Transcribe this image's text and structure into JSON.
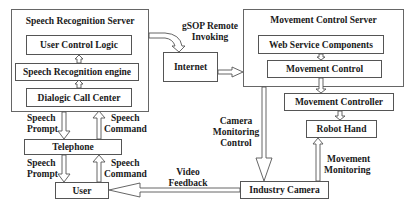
{
  "speech_server": {
    "title": "Speech Recognition Server",
    "components": [
      "User Control Logic",
      "Speech Recognition engine",
      "Dialogic Call Center"
    ]
  },
  "internet": {
    "label": "Internet"
  },
  "movement_server": {
    "title": "Movement Control Server",
    "components": [
      "Web Service Components",
      "Movement Control"
    ]
  },
  "movement_controller": {
    "label": "Movement Controller"
  },
  "robot_hand": {
    "label": "Robot Hand"
  },
  "telephone": {
    "label": "Telephone"
  },
  "user": {
    "label": "User"
  },
  "industry_camera": {
    "label": "Industry Camera"
  },
  "edge_labels": {
    "gsop_line1": "gSOP Remote",
    "gsop_line2": "Invoking",
    "prompt1_line1": "Speech",
    "prompt1_line2": "Prompt",
    "command1_line1": "Speech",
    "command1_line2": "Command",
    "prompt2_line1": "Speech",
    "prompt2_line2": "Prompt",
    "command2_line1": "Speech",
    "command2_line2": "Command",
    "camera_line1": "Camera",
    "camera_line2": "Monitoring",
    "camera_line3": "Control",
    "video_line1": "Video",
    "video_line2": "Feedback",
    "movmon_line1": "Movement",
    "movmon_line2": "Monitoring"
  }
}
